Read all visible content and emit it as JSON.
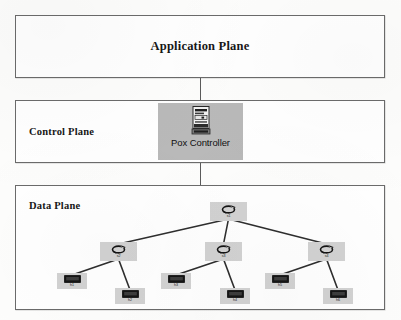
{
  "figure": {
    "planes": {
      "application": {
        "title": "Application Plane"
      },
      "control": {
        "title": "Control Plane"
      },
      "data": {
        "title": "Data Plane"
      }
    },
    "controller": {
      "label": "Pox Controller",
      "icon": "pc-tower-icon",
      "tile_color": "#b9b9b9"
    },
    "colors": {
      "box_border": "#6b6b6b",
      "connector": "#5a5a5a",
      "node_tile": "#d2d2d2",
      "controller_tile": "#b9b9b9",
      "text": "#171717",
      "link": "#2e2e2e",
      "page_background": "#fdfdfc"
    },
    "topology": {
      "type": "tree",
      "root": {
        "id": "s1",
        "label": "s1",
        "icon": "switch-icon",
        "x": 195,
        "y": 17
      },
      "switches": [
        {
          "id": "s2",
          "label": "s2",
          "icon": "switch-icon",
          "x": 85,
          "y": 57
        },
        {
          "id": "s3",
          "label": "s3",
          "icon": "switch-icon",
          "x": 190,
          "y": 57
        },
        {
          "id": "s4",
          "label": "s4",
          "icon": "switch-icon",
          "x": 293,
          "y": 57
        }
      ],
      "hosts": [
        {
          "id": "h1",
          "label": "h1",
          "icon": "host-icon",
          "parent": "s2",
          "x": 42,
          "y": 88
        },
        {
          "id": "h2",
          "label": "h2",
          "icon": "host-icon",
          "parent": "s2",
          "x": 100,
          "y": 103
        },
        {
          "id": "h3",
          "label": "h3",
          "icon": "host-icon",
          "parent": "s3",
          "x": 146,
          "y": 88
        },
        {
          "id": "h4",
          "label": "h4",
          "icon": "host-icon",
          "parent": "s3",
          "x": 205,
          "y": 103
        },
        {
          "id": "h5",
          "label": "h5",
          "icon": "host-icon",
          "parent": "s4",
          "x": 250,
          "y": 88
        },
        {
          "id": "h6",
          "label": "h6",
          "icon": "host-icon",
          "parent": "s4",
          "x": 308,
          "y": 103
        }
      ]
    }
  }
}
